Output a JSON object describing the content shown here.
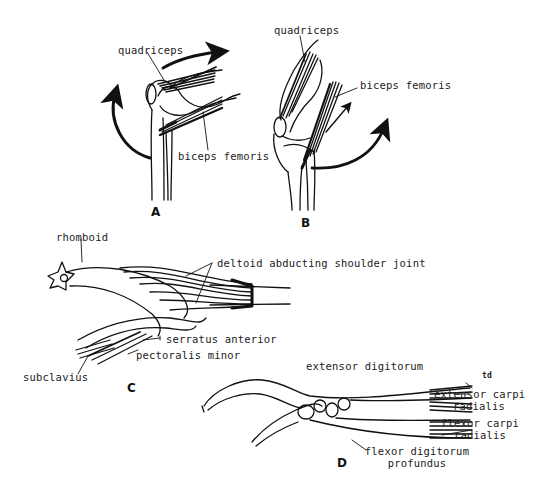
{
  "panels": {
    "A": {
      "label": "A",
      "labels": {
        "quadriceps": "quadriceps",
        "biceps_femoris": "biceps femoris"
      }
    },
    "B": {
      "label": "B",
      "labels": {
        "quadriceps": "quadriceps",
        "biceps_femoris": "biceps femoris"
      }
    },
    "C": {
      "label": "C",
      "labels": {
        "rhomboid": "rhomboid",
        "deltoid": "deltoid abducting shoulder joint",
        "serratus": "serratus anterior",
        "pectoralis": "pectoralis minor",
        "subclavius": "subclavius"
      }
    },
    "D": {
      "label": "D",
      "labels": {
        "extensor_digitorum": "extensor digitorum",
        "td_mark": "td",
        "extensor_carpi_1": "extensor carpi",
        "extensor_carpi_2": "radialis",
        "flexor_carpi_1": "flexor carpi",
        "flexor_carpi_2": "radialis",
        "flexor_digitorum_1": "flexor digitorum",
        "flexor_digitorum_2": "profundus"
      }
    }
  },
  "colors": {
    "ink": "#111111",
    "background": "#ffffff"
  }
}
